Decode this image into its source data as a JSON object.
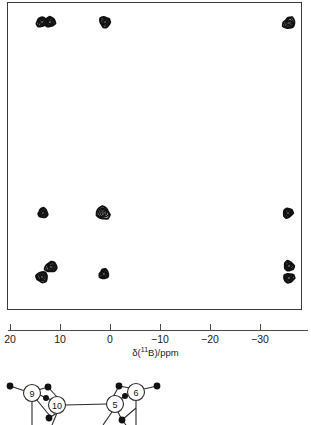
{
  "figure": {
    "type": "2d-nmr-contour-plot"
  },
  "chart_data": {
    "type": "scatter",
    "title": "",
    "subtitle": "",
    "xlabel": "δ(¹¹B)/ppm",
    "ylabel": "",
    "xlim": [
      22,
      -33
    ],
    "ylim": [
      0,
      1
    ],
    "grid": false,
    "legend": null,
    "axis": {
      "ticks": [
        20,
        10,
        0,
        -10,
        -20,
        -30
      ],
      "tick_labels": [
        "20",
        "10",
        "0",
        "−10",
        "−20",
        "−30"
      ],
      "tick_pixel_x": [
        10,
        60,
        110,
        160,
        210,
        260
      ],
      "direction": "decreasing-left-to-right"
    },
    "series": [
      {
        "name": "cross peaks",
        "marker": "contour-blob",
        "points": [
          {
            "id": "p1",
            "x_ppm": 13.8,
            "px": 41,
            "py": 21,
            "rx": 5.4,
            "ry": 4.6,
            "rot": -18
          },
          {
            "id": "p2",
            "x_ppm": 12.2,
            "px": 49,
            "py": 21,
            "rx": 5.2,
            "ry": 4.6,
            "rot": 12
          },
          {
            "id": "p3",
            "x_ppm": 1.2,
            "px": 104,
            "py": 21,
            "rx": 5.0,
            "ry": 5.2,
            "rot": 0
          },
          {
            "id": "p4",
            "x_ppm": -35.6,
            "px": 288,
            "py": 22,
            "rx": 6.0,
            "ry": 5.2,
            "rot": -28
          },
          {
            "id": "p5",
            "x_ppm": 13.6,
            "px": 42,
            "py": 212,
            "rx": 4.8,
            "ry": 4.4,
            "rot": -12
          },
          {
            "id": "p6",
            "x_ppm": 1.6,
            "px": 102,
            "py": 212,
            "rx": 6.4,
            "ry": 6.2,
            "rot": 14
          },
          {
            "id": "p7",
            "x_ppm": -35.4,
            "px": 287,
            "py": 212,
            "rx": 4.6,
            "ry": 4.6,
            "rot": 0
          },
          {
            "id": "p8",
            "x_ppm": 13.8,
            "px": 41,
            "py": 276,
            "rx": 5.6,
            "ry": 5.0,
            "rot": -22
          },
          {
            "id": "p9",
            "x_ppm": 12.0,
            "px": 50,
            "py": 266,
            "rx": 5.6,
            "ry": 5.0,
            "rot": -22
          },
          {
            "id": "p10",
            "x_ppm": 1.4,
            "px": 103,
            "py": 273,
            "rx": 4.6,
            "ry": 4.6,
            "rot": 0
          },
          {
            "id": "p11",
            "x_ppm": -35.6,
            "px": 288,
            "py": 265,
            "rx": 4.8,
            "ry": 4.6,
            "rot": 0
          },
          {
            "id": "p12",
            "x_ppm": -35.6,
            "px": 288,
            "py": 277,
            "rx": 5.0,
            "ry": 4.6,
            "rot": 0
          }
        ]
      }
    ],
    "colors": {
      "contour": "#111111",
      "frame": "#3a3a3a",
      "axis": "#4a4a4a",
      "background": "#ffffff"
    }
  },
  "axis_title": {
    "pre": "δ(",
    "isotope": "11",
    "post": "B)/ppm"
  },
  "molecule": {
    "caption": "",
    "vertices": [
      {
        "label": "9",
        "cx": 32,
        "cy": 21,
        "r": 8.5
      },
      {
        "label": "10",
        "cx": 57,
        "cy": 33,
        "r": 8.5
      },
      {
        "label": "5",
        "cx": 115,
        "cy": 32,
        "r": 8.5
      },
      {
        "label": "6",
        "cx": 136,
        "cy": 20,
        "r": 8.5
      }
    ],
    "atoms": [
      {
        "cx": 10,
        "cy": 14,
        "r": 3.4
      },
      {
        "cx": 48,
        "cy": 15,
        "r": 3.4
      },
      {
        "cx": 46,
        "cy": 26,
        "r": 3.0
      },
      {
        "cx": 49,
        "cy": 46,
        "r": 3.4
      },
      {
        "cx": 119,
        "cy": 14,
        "r": 3.4
      },
      {
        "cx": 125,
        "cy": 24,
        "r": 3.0
      },
      {
        "cx": 157,
        "cy": 14,
        "r": 3.4
      },
      {
        "cx": 122,
        "cy": 48,
        "r": 3.4
      }
    ],
    "bonds": [
      {
        "x1": 10,
        "y1": 14,
        "x2": 25,
        "y2": 19
      },
      {
        "x1": 38,
        "y1": 18,
        "x2": 48,
        "y2": 15
      },
      {
        "x1": 38,
        "y1": 22,
        "x2": 46,
        "y2": 26
      },
      {
        "x1": 48,
        "y1": 15,
        "x2": 57,
        "y2": 25
      },
      {
        "x1": 46,
        "y1": 26,
        "x2": 52,
        "y2": 28
      },
      {
        "x1": 32,
        "y1": 30,
        "x2": 32,
        "y2": 53
      },
      {
        "x1": 36,
        "y1": 27,
        "x2": 50,
        "y2": 44
      },
      {
        "x1": 57,
        "y1": 41,
        "x2": 52,
        "y2": 53
      },
      {
        "x1": 65,
        "y1": 33,
        "x2": 107,
        "y2": 32
      },
      {
        "x1": 49,
        "y1": 46,
        "x2": 57,
        "y2": 41
      },
      {
        "x1": 119,
        "y1": 14,
        "x2": 130,
        "y2": 16
      },
      {
        "x1": 119,
        "y1": 14,
        "x2": 113,
        "y2": 25
      },
      {
        "x1": 125,
        "y1": 24,
        "x2": 131,
        "y2": 22
      },
      {
        "x1": 125,
        "y1": 24,
        "x2": 119,
        "y2": 28
      },
      {
        "x1": 144,
        "y1": 17,
        "x2": 157,
        "y2": 14
      },
      {
        "x1": 136,
        "y1": 29,
        "x2": 136,
        "y2": 53
      },
      {
        "x1": 112,
        "y1": 40,
        "x2": 103,
        "y2": 53
      },
      {
        "x1": 118,
        "y1": 40,
        "x2": 122,
        "y2": 48
      },
      {
        "x1": 122,
        "y1": 48,
        "x2": 136,
        "y2": 36
      },
      {
        "x1": 122,
        "y1": 48,
        "x2": 126,
        "y2": 53
      }
    ]
  }
}
